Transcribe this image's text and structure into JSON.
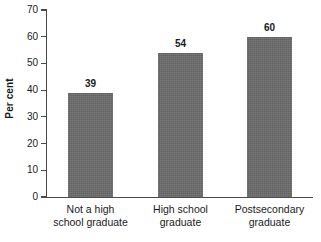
{
  "chart_data": {
    "type": "bar",
    "title": "",
    "subtitle": "",
    "xlabel": "",
    "ylabel": "Per cent",
    "ylim": [
      0,
      70
    ],
    "ytick_step": 10,
    "yticks": [
      70,
      60,
      50,
      40,
      30,
      20,
      10,
      0
    ],
    "ytick_labels": [
      "70",
      "60",
      "50",
      "40",
      "30",
      "20",
      "10",
      "0"
    ],
    "grid": false,
    "legend": false,
    "legend_position": "none",
    "categories": [
      "Not a high school graduate",
      "High school graduate",
      "Postsecondary graduate"
    ],
    "category_lines": [
      [
        "Not a high",
        "school graduate"
      ],
      [
        "High school",
        "graduate"
      ],
      [
        "Postsecondary",
        "graduate"
      ]
    ],
    "values": [
      39,
      54,
      60
    ],
    "value_labels": [
      "39",
      "54",
      "60"
    ],
    "colors": {
      "bar_fill": "#6b6b6b",
      "axis_line": "#4a4a4a",
      "text": "#1a1a1a",
      "background": "#ffffff"
    }
  }
}
